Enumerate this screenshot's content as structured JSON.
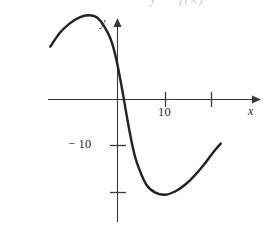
{
  "figure": {
    "header_partial_text": "y = f(x)",
    "background_color": "#ffffff",
    "curve_color": "#232323",
    "axis_color": "#3a3a3a",
    "axis_labels": {
      "y": "y",
      "x": "x"
    },
    "tick_labels": {
      "x_ten": "10",
      "y_negative_ten": "− 10"
    }
  },
  "chart_data": {
    "type": "line",
    "title": "y = f(x)",
    "xlabel": "x",
    "ylabel": "y",
    "grid": false,
    "legend": null,
    "xlim": [
      -14,
      22
    ],
    "ylim": [
      -26,
      20
    ],
    "x_ticks": [
      10,
      20
    ],
    "x_tick_labels": [
      "10",
      ""
    ],
    "y_ticks": [
      -10,
      -20
    ],
    "y_tick_labels": [
      "− 10",
      ""
    ],
    "annotations": [
      {
        "text": "y = f(x)",
        "note": "partially cropped at top edge of image"
      }
    ],
    "series": [
      {
        "name": "f",
        "description": "cubic-like curve: rises from lower-left to a local maximum left of the y-axis, falls steeply through the origin region, reaches a local minimum near x = 10, then rises again",
        "x": [
          -14.0,
          -12.0,
          -10.0,
          -8.0,
          -6.0,
          -4.0,
          -2.0,
          -1.0,
          0.0,
          1.0,
          2.0,
          3.0,
          4.0,
          6.0,
          8.0,
          10.0,
          12.0,
          14.0,
          16.0,
          18.0,
          20.0,
          21.5
        ],
        "y": [
          11.5,
          14.5,
          16.5,
          17.8,
          18.3,
          17.6,
          14.5,
          11.8,
          7.5,
          2.0,
          -4.0,
          -9.5,
          -13.6,
          -18.5,
          -20.3,
          -20.7,
          -20.0,
          -18.6,
          -16.6,
          -14.2,
          -11.4,
          -9.6
        ],
        "features": {
          "local_maximum": {
            "x": -6.0,
            "y": 18.3
          },
          "local_minimum": {
            "x": 10.0,
            "y": -20.7
          },
          "x_intercept": {
            "x": 0.4,
            "y": 0.0
          }
        }
      }
    ]
  }
}
